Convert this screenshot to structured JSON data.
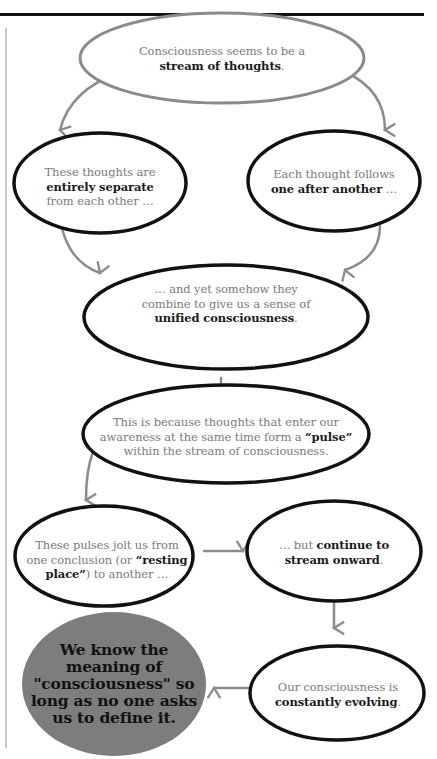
{
  "diagram": {
    "colors": {
      "outline_dark": "#111111",
      "outline_gray": "#8a8a8a",
      "arrow": "#8c8c8c",
      "final_fill": "#7d7d7d",
      "text_gray": "#7a7a7a",
      "text_bold": "#1a1a1a"
    },
    "nodes": [
      {
        "id": "n1",
        "pre": "Consciousness seems to be a",
        "bold": "stream of thoughts",
        "post": "."
      },
      {
        "id": "n2",
        "pre": "These thoughts are",
        "bold": "entirely separate",
        "post": "from each other …"
      },
      {
        "id": "n3",
        "pre": "Each thought follows",
        "bold": "one after another",
        "post": " …"
      },
      {
        "id": "n4",
        "pre1": "… and yet somehow they",
        "pre2": "combine to give us a sense of",
        "bold": "unified consciousness",
        "post": "."
      },
      {
        "id": "n5",
        "line1": "This is because thoughts that enter our",
        "line2_pre": "awareness at the same time form a ",
        "bold": "“pulse”",
        "line3": "within the stream of consciousness."
      },
      {
        "id": "n6",
        "line1": "These pulses jolt us from",
        "line2_pre": "one conclusion (or ",
        "bold1": "“resting",
        "bold2": "place”",
        "line3_post": ") to another …"
      },
      {
        "id": "n7",
        "pre": "… but ",
        "bold1": "continue to",
        "bold2": "stream onward",
        "post": "."
      },
      {
        "id": "n8",
        "pre": "Our consciousness is",
        "bold": "constantly evolving",
        "post": "."
      },
      {
        "id": "n9",
        "lines": [
          "We know the",
          "meaning of",
          "\"consciousness\" so",
          "long as no one asks",
          "us to define it."
        ]
      }
    ],
    "edges": [
      {
        "from": "n1",
        "to": "n2"
      },
      {
        "from": "n1",
        "to": "n3"
      },
      {
        "from": "n2",
        "to": "n4"
      },
      {
        "from": "n3",
        "to": "n4"
      },
      {
        "from": "n4",
        "to": "n5"
      },
      {
        "from": "n5",
        "to": "n6"
      },
      {
        "from": "n6",
        "to": "n7"
      },
      {
        "from": "n7",
        "to": "n8"
      },
      {
        "from": "n8",
        "to": "n9"
      }
    ]
  }
}
